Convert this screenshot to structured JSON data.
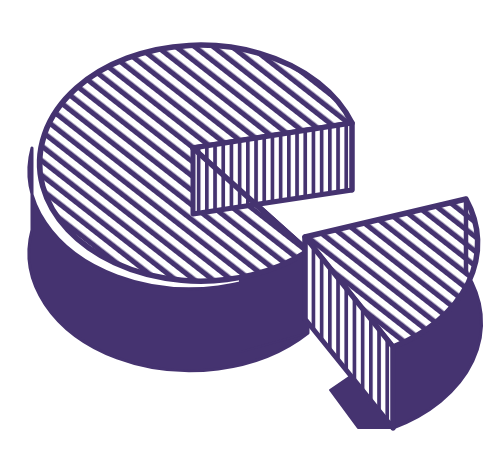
{
  "illustration": {
    "title": "Cut pie cylinder with separated wedge slice",
    "subject": "pie-slice-diagram",
    "canvas": {
      "width": 496,
      "height": 463,
      "background": "#ffffff"
    },
    "colors": {
      "ink": "#453370",
      "fill_solid": "#453370",
      "paper": "#ffffff"
    },
    "hatching": {
      "top_surface": {
        "pattern": "diagonal-stripes",
        "angle_deg": -52,
        "spacing_px": 11,
        "stroke_px": 5
      },
      "cut_face": {
        "pattern": "vertical-stripes",
        "spacing_px": 8,
        "stroke_px": 3.6
      },
      "side_wall": {
        "pattern": "solid"
      }
    },
    "parts": [
      {
        "name": "main-body",
        "label": "Cylinder with wedge removed",
        "top_surface_pattern": "diagonal-stripes",
        "side_wall_pattern": "solid",
        "notch_face_pattern": "vertical-stripes"
      },
      {
        "name": "wedge-slice",
        "label": "Separated wedge slice",
        "top_surface_pattern": "diagonal-stripes",
        "left_cut_face_pattern": "vertical-stripes",
        "outer_wall_pattern": "solid"
      }
    ],
    "geometry": {
      "body_center": {
        "x": 193,
        "y": 148
      },
      "body_radius_x": 161,
      "body_radius_y": 118,
      "body_depth_px": 82,
      "notch_start_angle_deg": -17,
      "notch_end_angle_deg": 44,
      "wedge_apex": {
        "x": 305,
        "y": 237
      },
      "wedge_bottom_point": {
        "x": 358,
        "y": 428
      }
    }
  }
}
